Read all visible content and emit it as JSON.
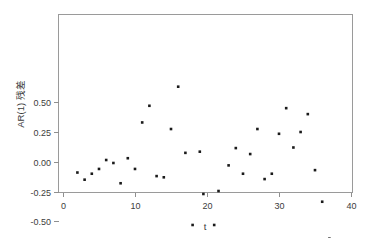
{
  "figure": {
    "faint_header_text": "",
    "background_color": "#ffffff",
    "frame_color": "#9a9a9a",
    "point_color": "#1a1a1a",
    "text_color": "#3c3c3c"
  },
  "chart_data": {
    "type": "scatter",
    "title": "",
    "xlabel": "t",
    "ylabel": "AR(1) 残差",
    "xlim": [
      0,
      40
    ],
    "ylim": [
      -0.8,
      0.68
    ],
    "xticks": [
      0,
      10,
      20,
      30,
      40
    ],
    "xticklabels": [
      "0",
      "10",
      "20",
      "30",
      "40"
    ],
    "yticks": [
      0.5,
      0.25,
      0.0,
      -0.25,
      -0.5,
      -0.75
    ],
    "yticklabels": [
      "0.50",
      "0.25",
      "0.00",
      "-0.25",
      "-0.50",
      "-0.75"
    ],
    "grid": false,
    "legend": null,
    "marker": "square",
    "marker_size": 2.6,
    "x": [
      2,
      3,
      4,
      5,
      6,
      7,
      8,
      9,
      10,
      11,
      12,
      13,
      14,
      15,
      16,
      17,
      18,
      19,
      19.5,
      21,
      21.6,
      23,
      24,
      25,
      26,
      27,
      28,
      29,
      30,
      31,
      32,
      33,
      34,
      35,
      36,
      37
    ],
    "y": [
      -0.09,
      -0.15,
      -0.1,
      -0.06,
      0.015,
      -0.01,
      -0.18,
      0.03,
      -0.06,
      0.33,
      0.47,
      -0.12,
      -0.13,
      0.275,
      0.63,
      0.075,
      -0.53,
      0.085,
      -0.27,
      -0.53,
      -0.245,
      -0.03,
      0.115,
      -0.1,
      0.065,
      0.275,
      -0.145,
      -0.1,
      0.235,
      0.45,
      0.12,
      0.25,
      0.4,
      -0.07,
      -0.335,
      -0.645
    ],
    "n_points": 36
  },
  "geometry": {
    "plot_left": 58,
    "plot_right": 353,
    "plot_top": 14,
    "plot_bottom": 193,
    "x0_px": 63,
    "px_per_x": 7.2,
    "y0_px": 161.8,
    "px_per_y": 119.2
  }
}
